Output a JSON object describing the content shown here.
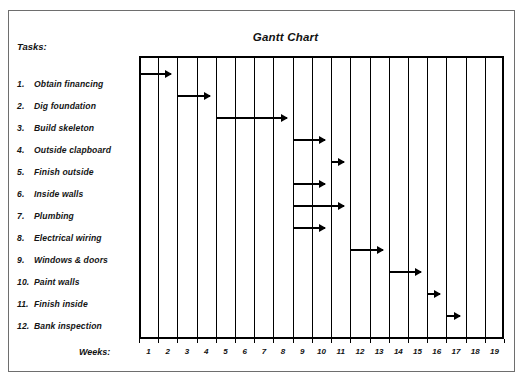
{
  "figure": {
    "title": "Gantt Chart",
    "tasks_heading": "Tasks:",
    "weeks_heading": "Weeks:"
  },
  "chart_data": {
    "type": "bar",
    "title": "Gantt Chart",
    "xlabel": "Weeks:",
    "ylabel": "Tasks:",
    "orientation": "horizontal",
    "grid": true,
    "legend": "none",
    "xlim": [
      0,
      19
    ],
    "week_ticks": [
      "1",
      "2",
      "3",
      "4",
      "5",
      "6",
      "7",
      "8",
      "9",
      "10",
      "11",
      "12",
      "13",
      "14",
      "15",
      "16",
      "17",
      "18",
      "19"
    ],
    "categories": [
      "1. Obtain financing",
      "2. Dig foundation",
      "3. Build skeleton",
      "4. Outside clapboard",
      "5. Finish outside",
      "6. Inside walls",
      "7. Plumbing",
      "8. Electrical wiring",
      "9. Windows & doors",
      "10. Paint walls",
      "11. Finish inside",
      "12. Bank inspection"
    ],
    "tasks": [
      {
        "num": "1.",
        "name": "Obtain financing",
        "label": "1. Obtain financing",
        "start_week": 0,
        "end_week": 2,
        "duration": 2
      },
      {
        "num": "2.",
        "name": "Dig foundation",
        "label": "2. Dig foundation",
        "start_week": 2,
        "end_week": 4,
        "duration": 2
      },
      {
        "num": "3.",
        "name": "Build skeleton",
        "label": "3. Build skeleton",
        "start_week": 4,
        "end_week": 8,
        "duration": 4
      },
      {
        "num": "4.",
        "name": "Outside clapboard",
        "label": "4. Outside clapboard",
        "start_week": 8,
        "end_week": 10,
        "duration": 2
      },
      {
        "num": "5.",
        "name": "Finish outside",
        "label": "5. Finish outside",
        "start_week": 10,
        "end_week": 11,
        "duration": 1
      },
      {
        "num": "6.",
        "name": "Inside walls",
        "label": "6. Inside walls",
        "start_week": 8,
        "end_week": 10,
        "duration": 2
      },
      {
        "num": "7.",
        "name": "Plumbing",
        "label": "7. Plumbing",
        "start_week": 8,
        "end_week": 11,
        "duration": 3
      },
      {
        "num": "8.",
        "name": "Electrical wiring",
        "label": "8. Electrical wiring",
        "start_week": 8,
        "end_week": 10,
        "duration": 2
      },
      {
        "num": "9.",
        "name": "Windows & doors",
        "label": "9. Windows & doors",
        "start_week": 11,
        "end_week": 13,
        "duration": 2
      },
      {
        "num": "10.",
        "name": "Paint walls",
        "label": "10. Paint walls",
        "start_week": 13,
        "end_week": 15,
        "duration": 2
      },
      {
        "num": "11.",
        "name": "Finish inside",
        "label": "11. Finish inside",
        "start_week": 15,
        "end_week": 16,
        "duration": 1
      },
      {
        "num": "12.",
        "name": "Bank inspection",
        "label": "12. Bank inspection",
        "start_week": 16,
        "end_week": 17,
        "duration": 1
      }
    ]
  },
  "colors": {
    "bar": "#000000",
    "grid": "#000000",
    "frame": "#6e6e6e",
    "background": "#ffffff",
    "text": "#111111"
  }
}
